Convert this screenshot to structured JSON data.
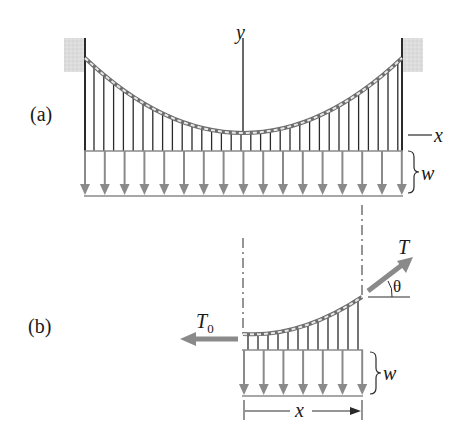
{
  "figure": {
    "part_a": {
      "label": "(a)",
      "axis_y_label": "y",
      "axis_x_label": "x",
      "load_label": "w",
      "hanger_count": 32,
      "load_arrow_count": 17
    },
    "part_b": {
      "label": "(b)",
      "tension_end_label": "T",
      "tension_bottom_label": "T",
      "tension_bottom_subscript": "0",
      "angle_label": "θ",
      "load_label": "w",
      "span_label": "x",
      "load_arrow_count": 7
    },
    "colors": {
      "line": "#2a2a2a",
      "arrow_gray": "#8a8a8a",
      "wall_fill": "#d9d9d9",
      "cable": "#6e6e6e"
    }
  }
}
